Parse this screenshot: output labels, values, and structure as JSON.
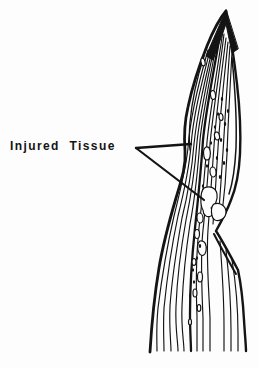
{
  "figure": {
    "label_text": "Injured Tissue",
    "ink_color": "#141414",
    "background_color": "#fdfdfd",
    "illustration_name": "leaf-blade-with-injured-tissue-lesions"
  }
}
